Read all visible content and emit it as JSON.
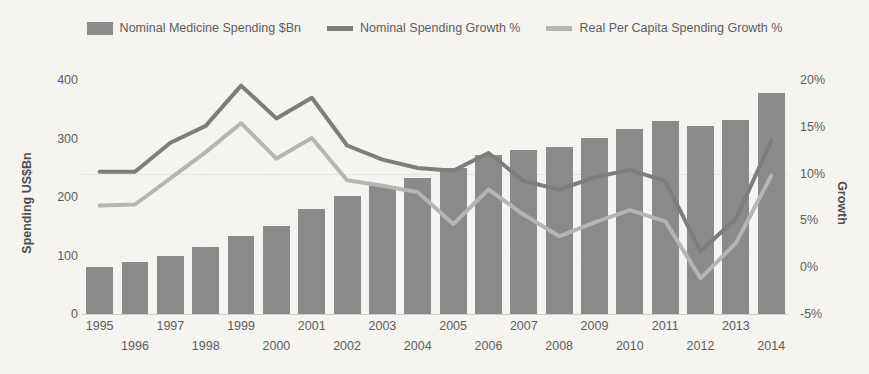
{
  "legend": {
    "items": [
      {
        "label": "Nominal Medicine Spending $Bn",
        "marker": "bar-swatch",
        "color": "#8c8c8c"
      },
      {
        "label": "Nominal Spending Growth %",
        "marker": "line-swatch",
        "color": "#7d7d7d"
      },
      {
        "label": "Real Per Capita Spending Growth %",
        "marker": "line-swatch",
        "color": "#b5b5b5"
      }
    ]
  },
  "axes": {
    "left_title": "Spending US$Bn",
    "right_title": "Growth",
    "left_ticks": [
      "400",
      "300",
      "200",
      "100",
      "0"
    ],
    "right_ticks": [
      "20%",
      "15%",
      "10%",
      "5%",
      "0%",
      "-5%"
    ]
  },
  "chart_data": {
    "type": "bar",
    "title": "",
    "xlabel": "",
    "ylabel": "Spending US$Bn",
    "y2label": "Growth",
    "ylim": [
      0,
      400
    ],
    "y2lim": [
      -5,
      20
    ],
    "grid": "single gridline at 10% / right axis",
    "legend_position": "top-center",
    "categories": [
      "1995",
      "1996",
      "1997",
      "1998",
      "1999",
      "2000",
      "2001",
      "2002",
      "2003",
      "2004",
      "2005",
      "2006",
      "2007",
      "2008",
      "2009",
      "2010",
      "2011",
      "2012",
      "2013",
      "2014"
    ],
    "series": [
      {
        "name": "Nominal Medicine Spending $Bn",
        "type": "bar",
        "axis": "left",
        "color": "#8a8a8a",
        "values": [
          81,
          89,
          99,
          114,
          133,
          151,
          179,
          201,
          218,
          232,
          250,
          271,
          280,
          286,
          301,
          317,
          330,
          321,
          331,
          378
        ]
      },
      {
        "name": "Nominal Spending Growth %",
        "type": "line",
        "axis": "right",
        "color": "#7d7d7d",
        "values": [
          10.2,
          10.2,
          13.3,
          15.1,
          19.4,
          15.9,
          18.1,
          13.0,
          11.5,
          10.6,
          10.3,
          12.2,
          9.2,
          8.3,
          9.6,
          10.4,
          9.2,
          1.7,
          5.2,
          13.5
        ]
      },
      {
        "name": "Real Per Capita Spending Growth %",
        "type": "line",
        "axis": "right",
        "color": "#b5b5b5",
        "values": [
          6.6,
          6.7,
          9.5,
          12.3,
          15.4,
          11.6,
          13.8,
          9.3,
          8.7,
          8.0,
          4.6,
          8.3,
          5.6,
          3.3,
          4.8,
          6.1,
          4.9,
          -1.2,
          2.6,
          9.8
        ]
      }
    ]
  }
}
